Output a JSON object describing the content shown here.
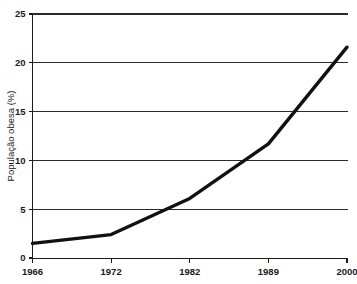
{
  "chart_data": {
    "type": "line",
    "title": "",
    "xlabel": "",
    "ylabel": "População obesa (%)",
    "categories": [
      "1966",
      "1972",
      "1982",
      "1989",
      "2000"
    ],
    "x_tick_labels": [
      "1966",
      "1972",
      "1982",
      "1989",
      "2000"
    ],
    "y_tick_labels": [
      "0",
      "5",
      "10",
      "15",
      "20",
      "25"
    ],
    "y_ticks": [
      0,
      5,
      10,
      15,
      20,
      25
    ],
    "ylim": [
      0,
      25
    ],
    "grid": "horizontal",
    "legend": "none",
    "series": [
      {
        "name": "População obesa (%)",
        "color": "#111111",
        "values": [
          1.5,
          2.4,
          6.1,
          11.7,
          21.6
        ]
      }
    ],
    "points": [
      {
        "x": "1966",
        "y": 1.5
      },
      {
        "x": "1972",
        "y": 2.4
      },
      {
        "x": "1982",
        "y": 6.1
      },
      {
        "x": "1989",
        "y": 11.7
      },
      {
        "x": "2000",
        "y": 21.6
      }
    ]
  }
}
